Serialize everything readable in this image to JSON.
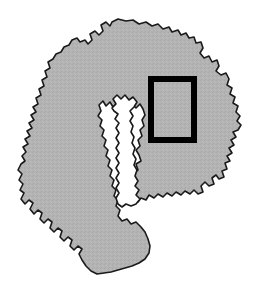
{
  "figure": {
    "type": "map-silhouette",
    "title": "",
    "width": 262,
    "height": 299,
    "background_color": "#ffffff"
  },
  "landmass": {
    "name": "landmass-silhouette",
    "fill_color": "#b3b3b3",
    "outline_color": "#1a1a1a",
    "outline_width": 1.6,
    "texture": "dithered-noise",
    "lobes": [
      "western-lobe",
      "eastern-lobe"
    ],
    "bounds": {
      "x": 18,
      "y": 19,
      "width": 224,
      "height": 258
    }
  },
  "inlet": {
    "name": "central-inlet",
    "fill_color": "#ffffff",
    "description": "white water inlet separating the two lobes, opening to the south",
    "bounds": {
      "x": 98,
      "y": 104,
      "width": 42,
      "height": 112
    }
  },
  "roi": {
    "name": "region-of-interest",
    "shape": "rectangle",
    "stroke_color": "#000000",
    "stroke_width": 6,
    "fill": "none",
    "x": 148,
    "y": 76,
    "width": 49,
    "height": 67
  },
  "chart_data": {
    "type": "map",
    "title": "",
    "xlabel": "",
    "ylabel": "",
    "legend": [],
    "annotations": [
      {
        "label": "region-of-interest-box",
        "kind": "rectangle",
        "x": 148,
        "y": 76,
        "width": 49,
        "height": 67,
        "color": "#000000"
      }
    ],
    "regions": [
      {
        "name": "landmass",
        "color": "#b3b3b3"
      },
      {
        "name": "water-inlet",
        "color": "#ffffff"
      },
      {
        "name": "background",
        "color": "#ffffff"
      }
    ]
  }
}
